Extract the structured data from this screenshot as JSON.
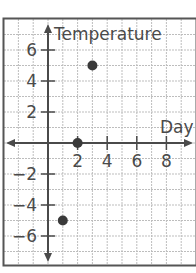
{
  "chart_data": {
    "type": "scatter",
    "title": "",
    "xlabel": "Day",
    "ylabel": "Temperature",
    "xlim": [
      -3,
      10
    ],
    "ylim": [
      -7,
      8
    ],
    "grid": true,
    "x_ticks": [
      2,
      4,
      6,
      8
    ],
    "y_ticks": [
      6,
      4,
      2,
      -2,
      -4,
      -6
    ],
    "points": [
      {
        "x": 3,
        "y": 5
      },
      {
        "x": 2,
        "y": 0
      },
      {
        "x": 1,
        "y": -5
      }
    ]
  },
  "colors": {
    "grid": "#bdbdbd",
    "axis": "#4a4a4a",
    "frame": "#555555",
    "point": "#3a3a3a"
  }
}
